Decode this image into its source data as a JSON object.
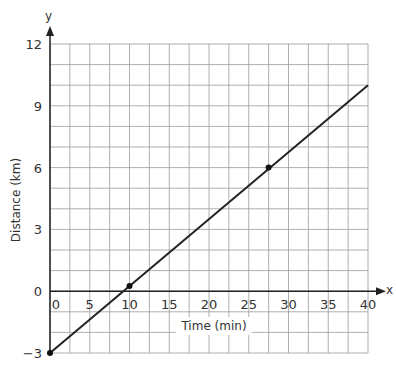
{
  "chart_data": {
    "type": "line",
    "title": "",
    "xlabel": "Time (min)",
    "ylabel": "Distance (km)",
    "x_axis_name": "x",
    "y_axis_name": "y",
    "xlim": [
      0,
      40
    ],
    "ylim": [
      -3,
      12
    ],
    "x_ticks": [
      "0",
      "5",
      "10",
      "15",
      "20",
      "25",
      "30",
      "35",
      "40"
    ],
    "y_ticks": [
      "12",
      "9",
      "6",
      "3",
      "0",
      "-3"
    ],
    "grid": true,
    "x_grid_step": 2.5,
    "y_grid_step": 1,
    "series": [
      {
        "name": "line",
        "x": [
          0,
          40
        ],
        "y": [
          -3,
          10
        ]
      }
    ],
    "points": [
      {
        "x": 0,
        "y": -3
      },
      {
        "x": 10,
        "y": 0.25
      },
      {
        "x": 27.5,
        "y": 6
      }
    ]
  }
}
